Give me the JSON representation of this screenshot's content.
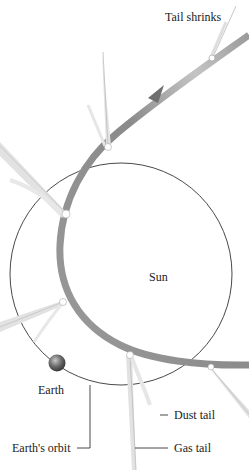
{
  "diagram": {
    "labels": {
      "tail_shrinks": "Tail shrinks",
      "sun": "Sun",
      "earth": "Earth",
      "earths_orbit": "Earth's orbit",
      "dust_tail": "Dust tail",
      "gas_tail": "Gas tail"
    },
    "colors": {
      "background": "#ffffff",
      "comet_path": "#8c8c8c",
      "comet_path_light": "#bdbdbd",
      "earth_orbit": "#333333",
      "tail": "#d9d9d9",
      "earth": "#6b6b6b",
      "text": "#222222"
    },
    "comet_positions": [
      {
        "name": "comet-top-right",
        "label": "Tail shrinks"
      },
      {
        "name": "comet-upper-middle"
      },
      {
        "name": "comet-upper-left"
      },
      {
        "name": "comet-left"
      },
      {
        "name": "comet-bottom"
      },
      {
        "name": "comet-bottom-right"
      }
    ]
  }
}
